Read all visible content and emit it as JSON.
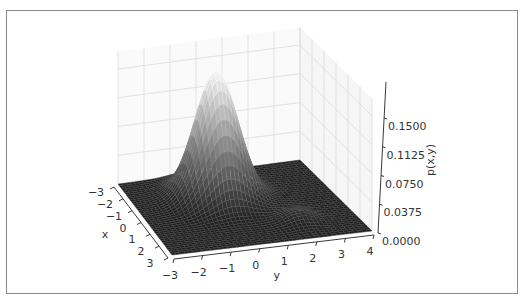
{
  "chart_data": {
    "type": "surface3d",
    "title": "",
    "xlabel": "x",
    "ylabel": "y",
    "zlabel": "p(x,y)",
    "x_ticks": [
      -3,
      -2,
      -1,
      0,
      1,
      2,
      3
    ],
    "y_ticks": [
      -3,
      -2,
      -1,
      0,
      1,
      2,
      3,
      4
    ],
    "z_ticks": [
      "0.0000",
      "0.0375",
      "0.0750",
      "0.1125",
      "0.1500"
    ],
    "xlim": [
      -3,
      3
    ],
    "ylim": [
      -3,
      4
    ],
    "zlim": [
      0,
      0.17
    ],
    "colormap": "gray",
    "components": [
      {
        "mean_x": -1.0,
        "mean_y": 0.0,
        "sigma_x": 0.8,
        "sigma_y": 0.75,
        "peak": 0.165
      },
      {
        "mean_x": 1.5,
        "mean_y": 2.0,
        "sigma_x": 0.5,
        "sigma_y": 0.5,
        "peak": 0.012
      }
    ],
    "grid": true
  }
}
